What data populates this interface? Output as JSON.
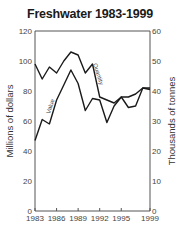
{
  "chart_data": {
    "type": "line",
    "title": "Freshwater 1983-1999",
    "xlabel": "",
    "ylabel": "Millions of dollars",
    "y2label": "Thousands of tonnes",
    "x": [
      1983,
      1984,
      1985,
      1986,
      1987,
      1988,
      1989,
      1990,
      1991,
      1992,
      1993,
      1994,
      1995,
      1996,
      1997,
      1998,
      1999
    ],
    "x_ticks": [
      "1983",
      "1986",
      "1989",
      "1992",
      "1995",
      "1999"
    ],
    "y_ticks": [
      "0",
      "20",
      "40",
      "60",
      "80",
      "100",
      "120"
    ],
    "y2_ticks": [
      "0",
      "10",
      "20",
      "30",
      "40",
      "50",
      "60"
    ],
    "ylim": [
      0,
      120
    ],
    "y2lim": [
      0,
      60
    ],
    "grid": false,
    "legend": "inline labels",
    "series": [
      {
        "name": "Value",
        "axis": "left",
        "unit": "Millions of dollars",
        "values": [
          47,
          61,
          58,
          74,
          84,
          94,
          85,
          67,
          75,
          74,
          59,
          70,
          76,
          69,
          70,
          82,
          81
        ]
      },
      {
        "name": "Quantity",
        "axis": "right",
        "unit": "Thousands of tonnes",
        "values": [
          49,
          44,
          48,
          46,
          50,
          53,
          52,
          46,
          49,
          38,
          37,
          36,
          38,
          38,
          39,
          41,
          41
        ]
      }
    ]
  }
}
